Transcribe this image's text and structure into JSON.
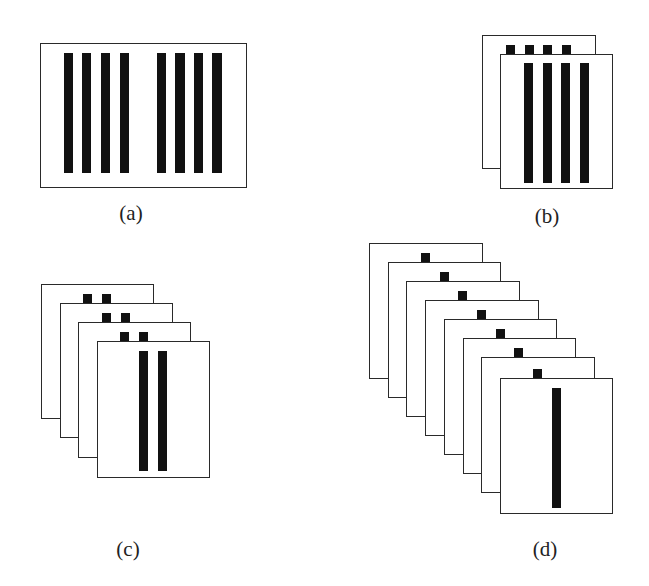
{
  "figure": {
    "panels": [
      {
        "id": "a",
        "label": "(a)",
        "description": "Single frame with two groups of four vertical bars",
        "frame": {
          "x": 40,
          "y": 43,
          "w": 207,
          "h": 145
        },
        "bars": [
          {
            "x": 64,
            "y": 53,
            "w": 9,
            "h": 120
          },
          {
            "x": 82,
            "y": 53,
            "w": 9,
            "h": 120
          },
          {
            "x": 101,
            "y": 53,
            "w": 9,
            "h": 120
          },
          {
            "x": 120,
            "y": 53,
            "w": 9,
            "h": 120
          },
          {
            "x": 157,
            "y": 53,
            "w": 9,
            "h": 120
          },
          {
            "x": 175,
            "y": 53,
            "w": 10,
            "h": 120
          },
          {
            "x": 194,
            "y": 53,
            "w": 9,
            "h": 120
          },
          {
            "x": 212,
            "y": 53,
            "w": 10,
            "h": 120
          }
        ],
        "label_pos": {
          "x": 101,
          "y": 201
        }
      },
      {
        "id": "b",
        "label": "(b)",
        "description": "Two stacked frames; back frame shows four small squares, front frame shows four vertical bars",
        "cards": [
          {
            "x": 482,
            "y": 35,
            "w": 114,
            "h": 134
          },
          {
            "x": 500,
            "y": 54,
            "w": 113,
            "h": 135
          }
        ],
        "squares": [
          {
            "x": 506,
            "y": 45,
            "s": 9
          },
          {
            "x": 525,
            "y": 45,
            "s": 9
          },
          {
            "x": 543,
            "y": 45,
            "s": 9
          },
          {
            "x": 562,
            "y": 45,
            "s": 9
          }
        ],
        "bars": [
          {
            "x": 524,
            "y": 63,
            "w": 9,
            "h": 120
          },
          {
            "x": 543,
            "y": 63,
            "w": 9,
            "h": 120
          },
          {
            "x": 561,
            "y": 63,
            "w": 9,
            "h": 120
          },
          {
            "x": 580,
            "y": 63,
            "w": 9,
            "h": 120
          }
        ],
        "label_pos": {
          "x": 517,
          "y": 204
        }
      },
      {
        "id": "c",
        "label": "(c)",
        "description": "Four stacked frames; back frames show pairs of small squares, front frame shows two vertical bars",
        "cards": [
          {
            "x": 41,
            "y": 284,
            "w": 113,
            "h": 135
          },
          {
            "x": 60,
            "y": 303,
            "w": 113,
            "h": 135
          },
          {
            "x": 78,
            "y": 322,
            "w": 113,
            "h": 136
          },
          {
            "x": 97,
            "y": 341,
            "w": 113,
            "h": 137
          }
        ],
        "squares": [
          {
            "x": 83,
            "y": 294,
            "s": 9
          },
          {
            "x": 102,
            "y": 294,
            "s": 9
          },
          {
            "x": 102,
            "y": 313,
            "s": 9
          },
          {
            "x": 121,
            "y": 313,
            "s": 9
          },
          {
            "x": 120,
            "y": 332,
            "s": 9
          },
          {
            "x": 139,
            "y": 332,
            "s": 9
          }
        ],
        "bars": [
          {
            "x": 139,
            "y": 351,
            "w": 9,
            "h": 120
          },
          {
            "x": 158,
            "y": 351,
            "w": 9,
            "h": 120
          }
        ],
        "label_pos": {
          "x": 98,
          "y": 537
        }
      },
      {
        "id": "d",
        "label": "(d)",
        "description": "Eight stacked frames; each back frame shows one small square, front frame shows one vertical bar",
        "cards": [
          {
            "x": 369,
            "y": 243,
            "w": 114,
            "h": 136
          },
          {
            "x": 388,
            "y": 262,
            "w": 113,
            "h": 136
          },
          {
            "x": 406,
            "y": 281,
            "w": 114,
            "h": 136
          },
          {
            "x": 425,
            "y": 300,
            "w": 114,
            "h": 136
          },
          {
            "x": 444,
            "y": 319,
            "w": 113,
            "h": 136
          },
          {
            "x": 463,
            "y": 338,
            "w": 113,
            "h": 136
          },
          {
            "x": 481,
            "y": 357,
            "w": 114,
            "h": 136
          },
          {
            "x": 500,
            "y": 378,
            "w": 113,
            "h": 136
          }
        ],
        "squares": [
          {
            "x": 421,
            "y": 253,
            "s": 9
          },
          {
            "x": 440,
            "y": 272,
            "s": 9
          },
          {
            "x": 458,
            "y": 291,
            "s": 9
          },
          {
            "x": 477,
            "y": 310,
            "s": 9
          },
          {
            "x": 496,
            "y": 329,
            "s": 9
          },
          {
            "x": 514,
            "y": 348,
            "s": 9
          },
          {
            "x": 533,
            "y": 369,
            "s": 9
          }
        ],
        "bars": [
          {
            "x": 552,
            "y": 388,
            "w": 9,
            "h": 120
          }
        ],
        "label_pos": {
          "x": 515,
          "y": 537
        }
      }
    ],
    "colors": {
      "ink": "#111111",
      "frame": "#2a2a2a",
      "background": "#ffffff"
    }
  }
}
